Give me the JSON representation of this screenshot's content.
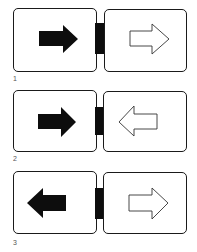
{
  "diagram": {
    "colors": {
      "stroke": "#1a1a1a",
      "fill_solid": "#0d0d0d",
      "fill_hollow": "#ffffff",
      "label": "#555555"
    },
    "figures": [
      {
        "label": "1",
        "left_arrow": {
          "direction": "right",
          "style": "solid"
        },
        "right_arrow": {
          "direction": "right",
          "style": "outline"
        }
      },
      {
        "label": "2",
        "left_arrow": {
          "direction": "right",
          "style": "solid"
        },
        "right_arrow": {
          "direction": "left",
          "style": "outline"
        }
      },
      {
        "label": "3",
        "left_arrow": {
          "direction": "left",
          "style": "solid"
        },
        "right_arrow": {
          "direction": "right",
          "style": "outline"
        }
      }
    ]
  }
}
